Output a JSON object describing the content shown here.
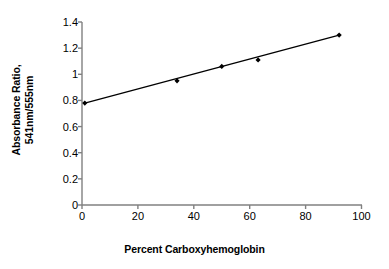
{
  "chart_data": {
    "type": "scatter",
    "title": "",
    "subtitle": "",
    "xlabel": "Percent Carboxyhemoglobin",
    "ylabel_line1": "Absorbance Ratio,",
    "ylabel_line2": "541nm/555nm",
    "xlim": [
      0,
      100
    ],
    "ylim": [
      0,
      1.4
    ],
    "xticks": [
      0,
      20,
      40,
      60,
      80,
      100
    ],
    "xticklabels": [
      "0",
      "20",
      "40",
      "60",
      "80",
      "100"
    ],
    "yticks": [
      0,
      0.2,
      0.4,
      0.6,
      0.8,
      1,
      1.2,
      1.4
    ],
    "yticklabels": [
      "0",
      "0.2",
      "0.4",
      "0.6",
      "0.8",
      "1",
      "1.2",
      "1.4"
    ],
    "grid": false,
    "legend": false,
    "legend_position": "none",
    "series": [
      {
        "name": "Absorbance ratio vs carboxyhemoglobin",
        "marker": "filled-diamond",
        "marker_color": "#000000",
        "line_color": "#000000",
        "x": [
          1,
          34,
          50,
          63,
          92
        ],
        "y": [
          0.78,
          0.95,
          1.06,
          1.11,
          1.3
        ]
      }
    ],
    "trendline": {
      "name": "linear fit",
      "color": "#000000",
      "x": [
        1,
        92
      ],
      "y": [
        0.78,
        1.3
      ]
    },
    "axis_color": "#808080",
    "text_color": "#000000",
    "background_color": "#ffffff"
  }
}
